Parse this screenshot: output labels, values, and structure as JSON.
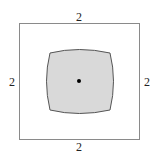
{
  "diagram": {
    "square": {
      "x": 19.5,
      "y": 23.5,
      "size": 120,
      "stroke": "#8a8a8a"
    },
    "shape": {
      "fill": "#d9d9d9",
      "stroke": "#555555",
      "path": "M50,53 Q79,45 109,53 Q117,81 109,110 Q79,117 50,110 Q42,81 50,53 Z"
    },
    "center_dot": {
      "cx": 79,
      "cy": 81,
      "r": 2
    },
    "labels": {
      "top": "2",
      "bottom": "2",
      "left": "2",
      "right": "2"
    }
  }
}
